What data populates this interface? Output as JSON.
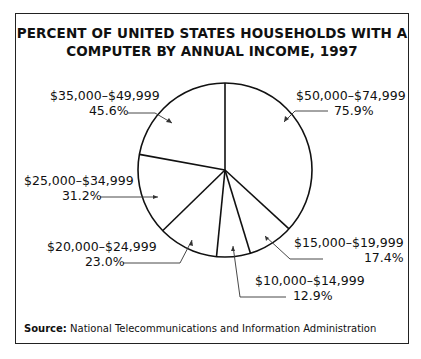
{
  "chart_data": {
    "type": "pie",
    "title": "PERCENT OF UNITED STATES HOUSEHOLDS WITH A COMPUTER BY ANNUAL INCOME, 1997",
    "categories": [
      "$50,000–$74,999",
      "$15,000–$19,999",
      "$10,000–$14,999",
      "$20,000–$24,999",
      "$25,000–$34,999",
      "$35,000–$49,999"
    ],
    "values": [
      75.9,
      17.4,
      12.9,
      23.0,
      31.2,
      45.6
    ],
    "value_labels": [
      "75.9%",
      "17.4%",
      "12.9%",
      "23.0%",
      "31.2%",
      "45.6%"
    ],
    "unit": "percent of households with a computer",
    "source": "National Telecommunications and Information Administration"
  },
  "title_line1": "PERCENT OF UNITED STATES HOUSEHOLDS WITH A",
  "title_line2": "COMPUTER BY ANNUAL INCOME, 1997",
  "labels": {
    "l50": {
      "range": "$50,000–$74,999",
      "pct": "75.9%"
    },
    "l35": {
      "range": "$35,000–$49,999",
      "pct": "45.6%"
    },
    "l25": {
      "range": "$25,000–$34,999",
      "pct": "31.2%"
    },
    "l20": {
      "range": "$20,000–$24,999",
      "pct": "23.0%"
    },
    "l10": {
      "range": "$10,000–$14,999",
      "pct": "12.9%"
    },
    "l15": {
      "range": "$15,000–$19,999",
      "pct": "17.4%"
    }
  },
  "source_label": "Source:",
  "source_text": "National Telecommunications and Information Administration"
}
